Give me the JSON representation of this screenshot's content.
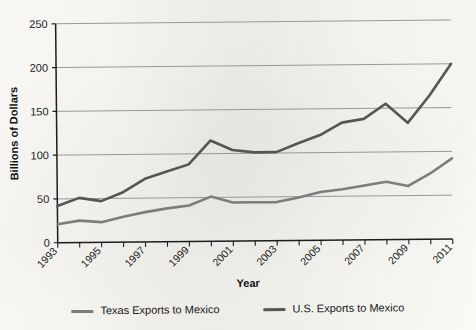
{
  "chart_data": {
    "type": "line",
    "title": "",
    "xlabel": "Year",
    "ylabel": "Billions of Dollars",
    "xlim": [
      1993,
      2011
    ],
    "ylim": [
      0,
      250
    ],
    "yticks": [
      0,
      50,
      100,
      150,
      200,
      250
    ],
    "ytick_labels": [
      "0",
      "50",
      "100",
      "150",
      "200",
      "250"
    ],
    "xticks": [
      1993,
      1995,
      1997,
      1999,
      2001,
      2003,
      2005,
      2007,
      2009,
      2011
    ],
    "xtick_labels": [
      "1993",
      "1995",
      "1997",
      "1999",
      "2001",
      "2003",
      "2005",
      "2007",
      "2009",
      "2011"
    ],
    "x": [
      1993,
      1994,
      1995,
      1996,
      1997,
      1998,
      1999,
      2000,
      2001,
      2002,
      2003,
      2004,
      2005,
      2006,
      2007,
      2008,
      2009,
      2010,
      2011
    ],
    "grid": true,
    "grid_axis": "y",
    "legend_position": "bottom",
    "series": [
      {
        "name": "Texas Exports to Mexico",
        "color": "#7d7d7d",
        "values": [
          21,
          25,
          23,
          29,
          34,
          38,
          41,
          51,
          44,
          44,
          44,
          49,
          55,
          58,
          62,
          66,
          61,
          75,
          92
        ]
      },
      {
        "name": "U.S. Exports to Mexico",
        "color": "#555555",
        "values": [
          42,
          51,
          47,
          57,
          72,
          80,
          88,
          115,
          104,
          101,
          101,
          111,
          120,
          134,
          138,
          155,
          133,
          164,
          200
        ]
      }
    ]
  },
  "axes": {
    "y_title": "Billions of Dollars",
    "x_title": "Year"
  },
  "legend": {
    "entries": [
      {
        "label": "Texas Exports to Mexico",
        "color": "#7d7d7d"
      },
      {
        "label": "U.S. Exports to Mexico",
        "color": "#555555"
      }
    ]
  }
}
